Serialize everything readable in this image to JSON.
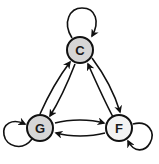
{
  "diagram": {
    "type": "directed-graph",
    "colors": {
      "edge": "#111111",
      "node_stroke": "#111111",
      "node_fill_default": "#d6d6d6",
      "node_fill_light": "#f2f2f2",
      "background": "#ffffff"
    },
    "nodes": [
      {
        "id": "C",
        "label": "C",
        "fill": "gray"
      },
      {
        "id": "G",
        "label": "G",
        "fill": "gray"
      },
      {
        "id": "F",
        "label": "F",
        "fill": "light"
      }
    ],
    "edges": [
      {
        "from": "C",
        "to": "C",
        "kind": "self-loop"
      },
      {
        "from": "G",
        "to": "G",
        "kind": "self-loop"
      },
      {
        "from": "F",
        "to": "F",
        "kind": "self-loop"
      },
      {
        "from": "G",
        "to": "C"
      },
      {
        "from": "C",
        "to": "G"
      },
      {
        "from": "C",
        "to": "F"
      },
      {
        "from": "F",
        "to": "C"
      },
      {
        "from": "G",
        "to": "F"
      },
      {
        "from": "F",
        "to": "G"
      }
    ]
  }
}
